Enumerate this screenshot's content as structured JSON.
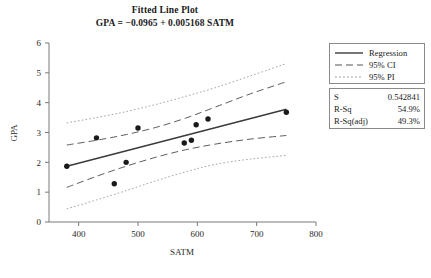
{
  "chart_data": {
    "type": "scatter",
    "title": "Fitted Line Plot",
    "subtitle": "GPA =  −0.0965 + 0.005168 SATM",
    "xlabel": "SATM",
    "ylabel": "GPA",
    "xlim": [
      350,
      800
    ],
    "ylim": [
      0,
      6
    ],
    "xticks": [
      400,
      500,
      600,
      700,
      800
    ],
    "yticks": [
      0,
      1,
      2,
      3,
      4,
      5,
      6
    ],
    "grid": false,
    "legend_position": "right",
    "points": [
      {
        "x": 380,
        "y": 1.87
      },
      {
        "x": 430,
        "y": 2.82
      },
      {
        "x": 460,
        "y": 1.28
      },
      {
        "x": 480,
        "y": 2.0
      },
      {
        "x": 500,
        "y": 3.15
      },
      {
        "x": 578,
        "y": 2.65
      },
      {
        "x": 590,
        "y": 2.74
      },
      {
        "x": 598,
        "y": 3.26
      },
      {
        "x": 618,
        "y": 3.45
      },
      {
        "x": 750,
        "y": 3.68
      }
    ],
    "fit": {
      "intercept": -0.0965,
      "slope": 0.005168,
      "x_start": 380,
      "x_end": 750
    },
    "ci_upper": [
      {
        "x": 380,
        "y": 2.58
      },
      {
        "x": 430,
        "y": 2.74
      },
      {
        "x": 480,
        "y": 2.93
      },
      {
        "x": 530,
        "y": 3.17
      },
      {
        "x": 580,
        "y": 3.48
      },
      {
        "x": 630,
        "y": 3.85
      },
      {
        "x": 690,
        "y": 4.3
      },
      {
        "x": 750,
        "y": 4.7
      }
    ],
    "ci_lower": [
      {
        "x": 380,
        "y": 1.16
      },
      {
        "x": 430,
        "y": 1.53
      },
      {
        "x": 480,
        "y": 1.87
      },
      {
        "x": 530,
        "y": 2.17
      },
      {
        "x": 580,
        "y": 2.42
      },
      {
        "x": 630,
        "y": 2.61
      },
      {
        "x": 690,
        "y": 2.78
      },
      {
        "x": 750,
        "y": 2.9
      }
    ],
    "pi_upper": [
      {
        "x": 380,
        "y": 3.32
      },
      {
        "x": 430,
        "y": 3.5
      },
      {
        "x": 480,
        "y": 3.7
      },
      {
        "x": 530,
        "y": 3.94
      },
      {
        "x": 580,
        "y": 4.21
      },
      {
        "x": 630,
        "y": 4.5
      },
      {
        "x": 690,
        "y": 4.9
      },
      {
        "x": 750,
        "y": 5.31
      }
    ],
    "pi_lower": [
      {
        "x": 380,
        "y": 0.44
      },
      {
        "x": 430,
        "y": 0.74
      },
      {
        "x": 480,
        "y": 1.05
      },
      {
        "x": 530,
        "y": 1.38
      },
      {
        "x": 580,
        "y": 1.68
      },
      {
        "x": 630,
        "y": 1.93
      },
      {
        "x": 690,
        "y": 2.11
      },
      {
        "x": 750,
        "y": 2.23
      }
    ],
    "series": [
      {
        "name": "Regression",
        "style": "solid"
      },
      {
        "name": "95% CI",
        "style": "dashed"
      },
      {
        "name": "95% PI",
        "style": "dotted"
      }
    ]
  },
  "legend": {
    "items": [
      {
        "label": "Regression",
        "style": "solid"
      },
      {
        "label": "95% CI",
        "style": "dashed"
      },
      {
        "label": "95% PI",
        "style": "dotted"
      }
    ]
  },
  "stats": {
    "rows": [
      {
        "key": "S",
        "value": "0.542841"
      },
      {
        "key": "R-Sq",
        "value": "54.9%"
      },
      {
        "key": "R-Sq(adj)",
        "value": "49.3%"
      }
    ]
  },
  "colors": {
    "line": "#3a3a3a",
    "ci": "#555555",
    "pi": "#9a9a9a",
    "marker": "#1a1a1a",
    "axis": "#7a7a7a",
    "text": "#1a1a1a"
  }
}
